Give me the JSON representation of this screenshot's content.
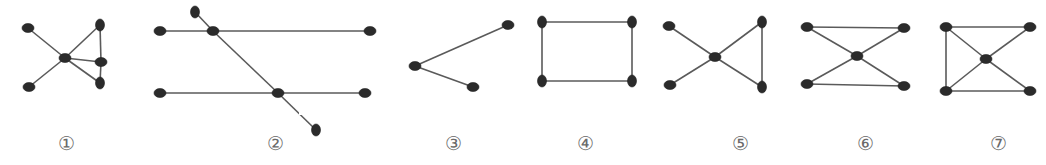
{
  "figure": {
    "node_color": "#2b2b2b",
    "edge_color": "#5a5a5a",
    "node_rx": 6,
    "node_ry": 4.5,
    "graphs": [
      {
        "id": "graph-1",
        "label": "①",
        "label_x": 66,
        "nodes": [
          [
            28,
            28
          ],
          [
            65,
            58
          ],
          [
            100,
            25
          ],
          [
            101,
            62
          ],
          [
            100,
            83
          ],
          [
            29,
            87
          ]
        ],
        "edges": [
          [
            0,
            1
          ],
          [
            1,
            2
          ],
          [
            1,
            3
          ],
          [
            1,
            4
          ],
          [
            1,
            5
          ],
          [
            2,
            3
          ],
          [
            3,
            4
          ]
        ],
        "vertical_nodes": [
          2,
          4
        ]
      },
      {
        "id": "graph-2",
        "label": "②",
        "label_x": 275,
        "nodes": [
          [
            195,
            12
          ],
          [
            160,
            31
          ],
          [
            213,
            31
          ],
          [
            370,
            31
          ],
          [
            160,
            93
          ],
          [
            278,
            93
          ],
          [
            365,
            93
          ],
          [
            316,
            130
          ]
        ],
        "edges": [
          [
            1,
            2
          ],
          [
            2,
            3
          ],
          [
            4,
            5
          ],
          [
            5,
            6
          ],
          [
            0,
            2
          ],
          [
            2,
            5
          ],
          [
            5,
            7
          ]
        ],
        "vertical_nodes": [
          0,
          7
        ]
      },
      {
        "id": "graph-3",
        "label": "③",
        "label_x": 453,
        "nodes": [
          [
            415,
            66
          ],
          [
            508,
            25
          ],
          [
            473,
            87
          ]
        ],
        "edges": [
          [
            0,
            1
          ],
          [
            0,
            2
          ]
        ],
        "vertical_nodes": []
      },
      {
        "id": "graph-4",
        "label": "④",
        "label_x": 585,
        "nodes": [
          [
            542,
            22
          ],
          [
            632,
            22
          ],
          [
            542,
            81
          ],
          [
            632,
            81
          ]
        ],
        "edges": [
          [
            0,
            1
          ],
          [
            1,
            3
          ],
          [
            3,
            2
          ],
          [
            2,
            0
          ]
        ],
        "vertical_nodes": [
          0,
          1,
          2,
          3
        ]
      },
      {
        "id": "graph-5",
        "label": "⑤",
        "label_x": 740,
        "nodes": [
          [
            669,
            26
          ],
          [
            715,
            57
          ],
          [
            762,
            22
          ],
          [
            670,
            85
          ],
          [
            762,
            87
          ]
        ],
        "edges": [
          [
            0,
            1
          ],
          [
            1,
            2
          ],
          [
            1,
            3
          ],
          [
            1,
            4
          ],
          [
            2,
            4
          ]
        ],
        "vertical_nodes": [
          2,
          4
        ]
      },
      {
        "id": "graph-6",
        "label": "⑥",
        "label_x": 865,
        "nodes": [
          [
            807,
            27
          ],
          [
            904,
            28
          ],
          [
            857,
            56
          ],
          [
            807,
            84
          ],
          [
            904,
            86
          ]
        ],
        "edges": [
          [
            0,
            1
          ],
          [
            3,
            4
          ],
          [
            0,
            2
          ],
          [
            1,
            2
          ],
          [
            2,
            3
          ],
          [
            2,
            4
          ]
        ],
        "vertical_nodes": []
      },
      {
        "id": "graph-7",
        "label": "⑦",
        "label_x": 998,
        "nodes": [
          [
            946,
            27
          ],
          [
            1030,
            27
          ],
          [
            986,
            59
          ],
          [
            946,
            91
          ],
          [
            1030,
            91
          ]
        ],
        "edges": [
          [
            0,
            1
          ],
          [
            3,
            4
          ],
          [
            0,
            3
          ],
          [
            0,
            2
          ],
          [
            1,
            2
          ],
          [
            2,
            3
          ],
          [
            2,
            4
          ]
        ],
        "vertical_nodes": []
      }
    ]
  }
}
